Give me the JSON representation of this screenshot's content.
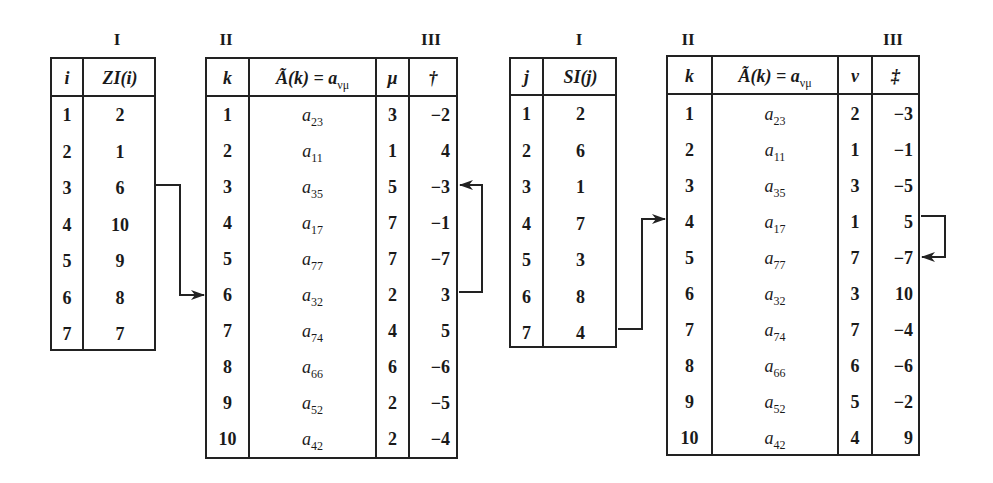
{
  "group_left": {
    "labels": {
      "I": "I",
      "II": "II",
      "III": "III"
    },
    "table_I": {
      "headers": {
        "index": "i",
        "value": "ZI(i)"
      },
      "rows": [
        {
          "index": "1",
          "value": "2"
        },
        {
          "index": "2",
          "value": "1"
        },
        {
          "index": "3",
          "value": "6"
        },
        {
          "index": "4",
          "value": "10"
        },
        {
          "index": "5",
          "value": "9"
        },
        {
          "index": "6",
          "value": "8"
        },
        {
          "index": "7",
          "value": "7"
        }
      ]
    },
    "table_II_III": {
      "headers": {
        "k": "k",
        "element": "Ã(k) = a",
        "element_sub": "νμ",
        "col3": "μ",
        "col4": "†"
      },
      "rows": [
        {
          "k": "1",
          "a": "a",
          "sub": "23",
          "c3": "3",
          "c4": "−2"
        },
        {
          "k": "2",
          "a": "a",
          "sub": "11",
          "c3": "1",
          "c4": "4"
        },
        {
          "k": "3",
          "a": "a",
          "sub": "35",
          "c3": "5",
          "c4": "−3"
        },
        {
          "k": "4",
          "a": "a",
          "sub": "17",
          "c3": "7",
          "c4": "−1"
        },
        {
          "k": "5",
          "a": "a",
          "sub": "77",
          "c3": "7",
          "c4": "−7"
        },
        {
          "k": "6",
          "a": "a",
          "sub": "32",
          "c3": "2",
          "c4": "3"
        },
        {
          "k": "7",
          "a": "a",
          "sub": "74",
          "c3": "4",
          "c4": "5"
        },
        {
          "k": "8",
          "a": "a",
          "sub": "66",
          "c3": "6",
          "c4": "−6"
        },
        {
          "k": "9",
          "a": "a",
          "sub": "52",
          "c3": "2",
          "c4": "−5"
        },
        {
          "k": "10",
          "a": "a",
          "sub": "42",
          "c3": "2",
          "c4": "−4"
        }
      ]
    }
  },
  "group_right": {
    "labels": {
      "I": "I",
      "II": "II",
      "III": "III"
    },
    "table_I": {
      "headers": {
        "index": "j",
        "value": "SI(j)"
      },
      "rows": [
        {
          "index": "1",
          "value": "2"
        },
        {
          "index": "2",
          "value": "6"
        },
        {
          "index": "3",
          "value": "1"
        },
        {
          "index": "4",
          "value": "7"
        },
        {
          "index": "5",
          "value": "3"
        },
        {
          "index": "6",
          "value": "8"
        },
        {
          "index": "7",
          "value": "4"
        }
      ]
    },
    "table_II_III": {
      "headers": {
        "k": "k",
        "element": "Ã(k) = a",
        "element_sub": "νμ",
        "col3": "ν",
        "col4": "‡"
      },
      "rows": [
        {
          "k": "1",
          "a": "a",
          "sub": "23",
          "c3": "2",
          "c4": "−3"
        },
        {
          "k": "2",
          "a": "a",
          "sub": "11",
          "c3": "1",
          "c4": "−1"
        },
        {
          "k": "3",
          "a": "a",
          "sub": "35",
          "c3": "3",
          "c4": "−5"
        },
        {
          "k": "4",
          "a": "a",
          "sub": "17",
          "c3": "1",
          "c4": "5"
        },
        {
          "k": "5",
          "a": "a",
          "sub": "77",
          "c3": "7",
          "c4": "−7"
        },
        {
          "k": "6",
          "a": "a",
          "sub": "32",
          "c3": "3",
          "c4": "10"
        },
        {
          "k": "7",
          "a": "a",
          "sub": "74",
          "c3": "7",
          "c4": "−4"
        },
        {
          "k": "8",
          "a": "a",
          "sub": "66",
          "c3": "6",
          "c4": "−6"
        },
        {
          "k": "9",
          "a": "a",
          "sub": "52",
          "c3": "5",
          "c4": "−2"
        },
        {
          "k": "10",
          "a": "a",
          "sub": "42",
          "c3": "4",
          "c4": "9"
        }
      ]
    }
  },
  "arrows": [
    {
      "from": "ZI(3)=6",
      "to": "row k=6 (left table II)"
    },
    {
      "from": "† of k=6 (3)",
      "to": "row k=3 (left table III)"
    },
    {
      "from": "SI(7)=4",
      "to": "row k=4 (right table II)"
    },
    {
      "from": "‡ of k=4 (5)",
      "to": "row k=5 (right table III)"
    }
  ],
  "colors": {
    "ink": "#222222",
    "background": "#ffffff"
  }
}
